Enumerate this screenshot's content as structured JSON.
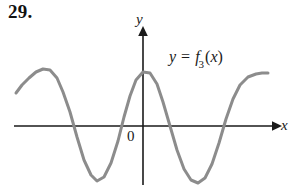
{
  "figure": {
    "problem_number": "29.",
    "origin_label": "0",
    "axes": {
      "y_axis_label": "y",
      "x_axis_label": "x",
      "y_axis_icon": "up-arrow-icon",
      "x_axis_icon": "right-arrow-icon",
      "axis_color": "#1a1a1a"
    },
    "curve": {
      "label_full": "y = f3(x)",
      "label_lhs": "y",
      "label_operator": "=",
      "label_func": "f",
      "label_subscript": "3",
      "label_open_paren": "(",
      "label_arg": "x",
      "label_close_paren": ")",
      "color": "#8c8c8c"
    }
  },
  "chart_data": {
    "type": "line",
    "title": "",
    "subtitle": "",
    "xlabel": "x",
    "ylabel": "y",
    "legend": [
      "y = f3(x)"
    ],
    "legend_position": "inside-upper-right",
    "grid": false,
    "axis_origin_px": [
      143,
      126
    ],
    "xlim_px": [
      16,
      268
    ],
    "ylim_px": [
      185,
      30
    ],
    "annotations": [
      {
        "text": "0",
        "x_px": 130,
        "y_px": 137,
        "role": "origin"
      },
      {
        "text": "y = f3(x)",
        "x_px": 170,
        "y_px": 57,
        "role": "curve-label"
      },
      {
        "text": "29.",
        "x_px": 10,
        "y_px": 10,
        "role": "problem-number"
      }
    ],
    "series": [
      {
        "name": "y = f3(x)",
        "points_px": [
          [
            16,
            93
          ],
          [
            22,
            85
          ],
          [
            29,
            78
          ],
          [
            36,
            72
          ],
          [
            43,
            69
          ],
          [
            50,
            70
          ],
          [
            57,
            78
          ],
          [
            63,
            92
          ],
          [
            70,
            112
          ],
          [
            77,
            137
          ],
          [
            84,
            160
          ],
          [
            91,
            175
          ],
          [
            97,
            181
          ],
          [
            104,
            177
          ],
          [
            111,
            163
          ],
          [
            118,
            141
          ],
          [
            124,
            117
          ],
          [
            130,
            96
          ],
          [
            136,
            80
          ],
          [
            143,
            72
          ],
          [
            150,
            73
          ],
          [
            157,
            84
          ],
          [
            163,
            102
          ],
          [
            170,
            126
          ],
          [
            177,
            150
          ],
          [
            184,
            169
          ],
          [
            191,
            180
          ],
          [
            198,
            183
          ],
          [
            205,
            178
          ],
          [
            212,
            164
          ],
          [
            219,
            143
          ],
          [
            226,
            119
          ],
          [
            233,
            99
          ],
          [
            240,
            85
          ],
          [
            248,
            77
          ],
          [
            256,
            74
          ],
          [
            262,
            73
          ],
          [
            268,
            73
          ]
        ]
      }
    ]
  }
}
